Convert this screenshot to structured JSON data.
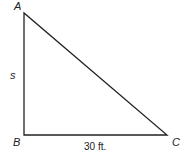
{
  "diagram": {
    "type": "right-triangle",
    "vertices": {
      "A": {
        "label": "A",
        "x": 24,
        "y": 13
      },
      "B": {
        "label": "B",
        "x": 24,
        "y": 135
      },
      "C": {
        "label": "C",
        "x": 167,
        "y": 135
      }
    },
    "sides": {
      "AB": {
        "label": "s"
      },
      "BC": {
        "label": "30 ft."
      }
    },
    "stroke_color": "#222222"
  }
}
